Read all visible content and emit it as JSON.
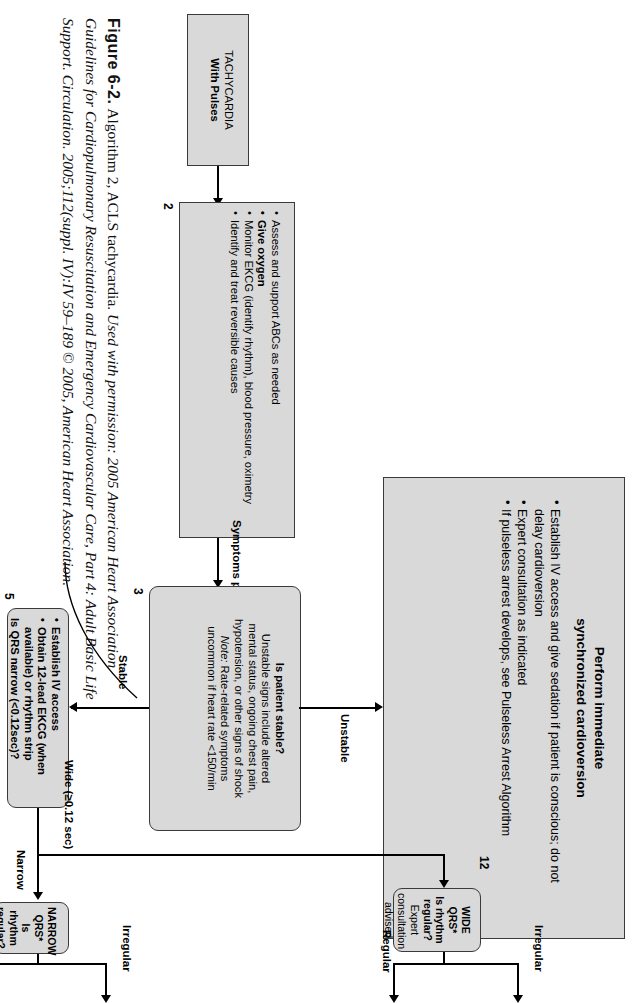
{
  "figure": {
    "number": "Figure 6-2.",
    "title": "Algorithm 2, ACLS tachycardia.",
    "credit_line1": "Used with permission: 2005 American Heart Association",
    "credit_line2": "Guidelines for Cardiopulmonary Resuscitation and Emergency Cardiovascular Care, Part 4: Adult Basic Life",
    "credit_line3": "Support. Circulation. 2005;112(suppl. IV):IV 59–189 © 2005, American Heart Association."
  },
  "start": {
    "line1": "TACHYCARDIA",
    "line2": "With Pulses"
  },
  "box2": {
    "number": "2",
    "bullets": [
      "Assess and support ABCs as needed",
      "Give oxygen",
      "Monitor EKCG (identify rhythm), blood pressure, oximetry",
      "Identify and treat reversible causes"
    ],
    "bold_bullet_index": 1
  },
  "box3": {
    "number": "3",
    "heading": "Is patient stable?",
    "line1": "Unstable signs include altered",
    "line2": "mental status, ongoing chest pain,",
    "line3": "hypotension, or other signs of shock",
    "note_label": "Note:",
    "note_line1": " Rate-related symptoms",
    "note_line2": "uncommon if heart rate <150/min"
  },
  "box4": {
    "number": "4",
    "title_line1": "Perform immediate",
    "title_line2": "synchronized cardioversion",
    "bullets": [
      "Establish IV access and give sedation if patient is conscious; do not delay cardioversion",
      "Expert consultation as indicated",
      "If pulseless arrest develops, see Pulseless Arrest Algorithm"
    ]
  },
  "box5": {
    "number": "5",
    "bullets": [
      "Establish IV access",
      "Obtain 12-lead EKCG (when available) or rhythm strip"
    ],
    "question": "Is QRS narrow (<0.12sec)?"
  },
  "box6": {
    "number": "6",
    "title": "NARROW QRS*",
    "question": "Is rhythm regular?"
  },
  "box12": {
    "number": "12",
    "title": "WIDE QRS*",
    "question": "Is rhythm regular?",
    "note_line1": "Expert consultation",
    "note_line2": "advised"
  },
  "edges": {
    "symptoms_persist": "Symptoms persist",
    "unstable": "Unstable",
    "stable": "Stable",
    "wide": "Wide (≥0.12 sec)",
    "narrow": "Narrow",
    "wide_regular": "Regular",
    "wide_irregular": "Irregular",
    "narrow_regular": "Regular",
    "narrow_irregular": "Irregular"
  },
  "colors": {
    "box_fill": "#d9d9d9",
    "box_border": "#3a3a3a",
    "line": "#000000",
    "page_bg": "#ffffff"
  }
}
